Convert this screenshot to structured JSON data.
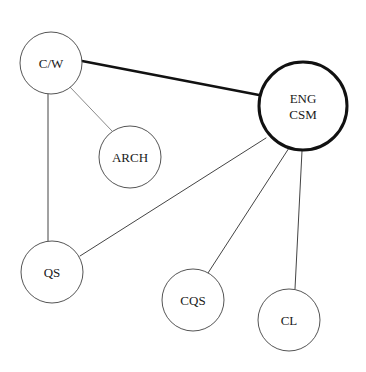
{
  "diagram": {
    "type": "network",
    "nodes": [
      {
        "id": "cw",
        "lines": [
          "C/W"
        ],
        "cx": 51,
        "cy": 63,
        "r": 31,
        "stroke": "#555555",
        "stroke_width": 1
      },
      {
        "id": "arch",
        "lines": [
          "ARCH"
        ],
        "cx": 130,
        "cy": 157,
        "r": 31,
        "stroke": "#555555",
        "stroke_width": 1
      },
      {
        "id": "eng_csm",
        "lines": [
          "ENG",
          "CSM"
        ],
        "cx": 303,
        "cy": 106,
        "r": 44,
        "stroke": "#111111",
        "stroke_width": 3
      },
      {
        "id": "qs",
        "lines": [
          "QS"
        ],
        "cx": 52,
        "cy": 272,
        "r": 31,
        "stroke": "#555555",
        "stroke_width": 1
      },
      {
        "id": "cqs",
        "lines": [
          "CQS"
        ],
        "cx": 193,
        "cy": 300,
        "r": 31,
        "stroke": "#555555",
        "stroke_width": 1
      },
      {
        "id": "cl",
        "lines": [
          "CL"
        ],
        "cx": 289,
        "cy": 320,
        "r": 31,
        "stroke": "#555555",
        "stroke_width": 1
      }
    ],
    "edges": [
      {
        "from": "cw",
        "to": "eng_csm",
        "x1": 82,
        "y1": 61,
        "x2": 259,
        "y2": 95,
        "weight": "strong",
        "stroke": "#111111",
        "stroke_width": 2.5
      },
      {
        "from": "cw",
        "to": "arch",
        "x1": 70,
        "y1": 87,
        "x2": 112,
        "y2": 131,
        "weight": "weak",
        "stroke": "#8a8a8a",
        "stroke_width": 1
      },
      {
        "from": "cw",
        "to": "qs",
        "x1": 48,
        "y1": 94,
        "x2": 48,
        "y2": 241,
        "weight": "normal",
        "stroke": "#444444",
        "stroke_width": 1
      },
      {
        "from": "eng_csm",
        "to": "qs",
        "x1": 266,
        "y1": 138,
        "x2": 80,
        "y2": 256,
        "weight": "normal",
        "stroke": "#444444",
        "stroke_width": 1
      },
      {
        "from": "eng_csm",
        "to": "cqs",
        "x1": 289,
        "y1": 148,
        "x2": 208,
        "y2": 273,
        "weight": "normal",
        "stroke": "#444444",
        "stroke_width": 1
      },
      {
        "from": "eng_csm",
        "to": "cl",
        "x1": 302,
        "y1": 151,
        "x2": 295,
        "y2": 289,
        "weight": "normal",
        "stroke": "#444444",
        "stroke_width": 1
      }
    ]
  },
  "colors": {
    "background": "#ffffff",
    "label": "#1a1a1a"
  }
}
